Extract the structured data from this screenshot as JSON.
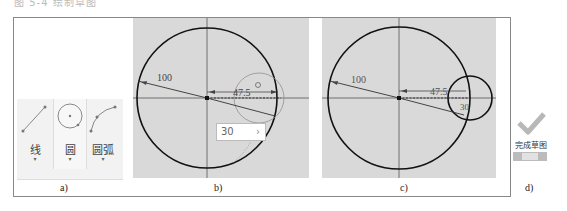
{
  "figure": {
    "caption_top": "图 5-4 绘制草图"
  },
  "panel_a": {
    "label": "a)",
    "tools": [
      {
        "name": "line",
        "label": "线",
        "icon": "line-icon"
      },
      {
        "name": "circle",
        "label": "圆",
        "icon": "circle-icon",
        "selected": true
      },
      {
        "name": "arc",
        "label": "圆弧",
        "icon": "arc-icon"
      }
    ],
    "dropdown_glyph": "▾"
  },
  "panel_b": {
    "label": "b)",
    "dims": {
      "big_radius": "100",
      "offset": "47.5"
    },
    "input": {
      "value": "30",
      "arrow": "›"
    }
  },
  "panel_c": {
    "label": "c)",
    "dims": {
      "big_radius": "100",
      "offset": "47.5",
      "small_radius": "30"
    }
  },
  "panel_d": {
    "label": "d)",
    "finish_label": "完成草图",
    "exit_label": "退出",
    "colors": {
      "check": "#b8b8b8",
      "bar": "#bcbcbc"
    }
  }
}
